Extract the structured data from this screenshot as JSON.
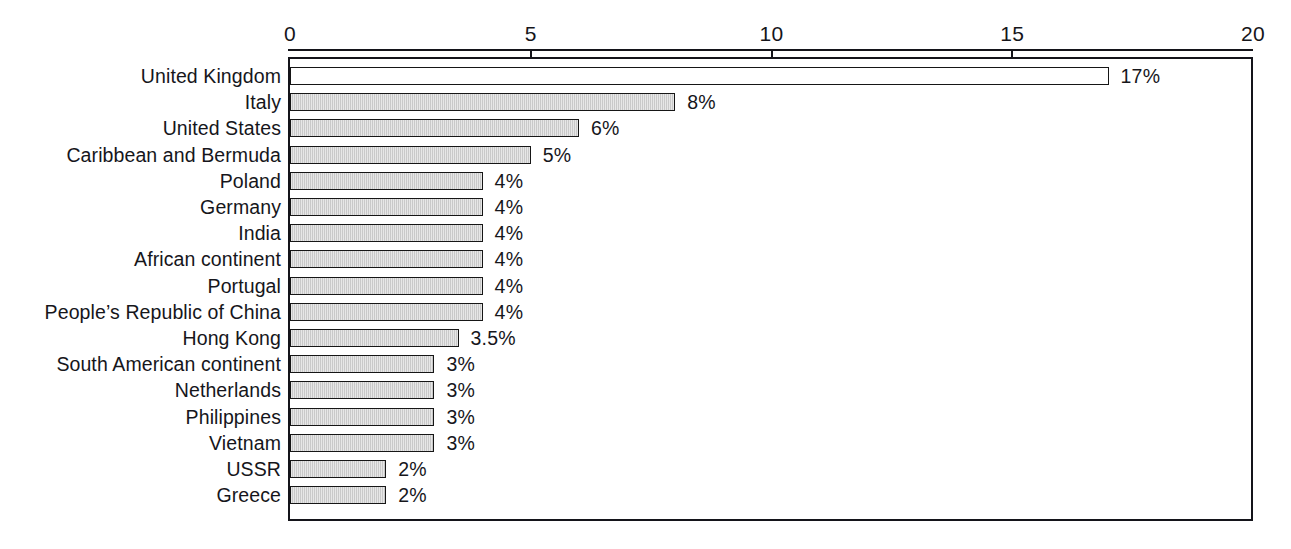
{
  "chart_data": {
    "type": "bar",
    "orientation": "horizontal",
    "title": "",
    "subtitle": "",
    "xlabel": "",
    "ylabel": "",
    "xlim": [
      0,
      20
    ],
    "grid": false,
    "legend": false,
    "axis_ticks": [
      "0",
      "5",
      "10",
      "15",
      "20"
    ],
    "axis_tick_values": [
      0,
      5,
      10,
      15,
      20
    ],
    "categories": [
      "United Kingdom",
      "Italy",
      "United States",
      "Caribbean and Bermuda",
      "Poland",
      "Germany",
      "India",
      "African continent",
      "Portugal",
      "People’s Republic of China",
      "Hong Kong",
      "South American continent",
      "Netherlands",
      "Philippines",
      "Vietnam",
      "USSR",
      "Greece"
    ],
    "values": [
      17,
      8,
      6,
      5,
      4,
      4,
      4,
      4,
      4,
      4,
      3.5,
      3,
      3,
      3,
      3,
      2,
      2
    ],
    "data_labels": [
      "17%",
      "8%",
      "6%",
      "5%",
      "4%",
      "4%",
      "4%",
      "4%",
      "4%",
      "4%",
      "3.5%",
      "3%",
      "3%",
      "3%",
      "3%",
      "2%",
      "2%"
    ],
    "bar_styles": [
      "unfilled",
      "filled",
      "filled",
      "filled",
      "filled",
      "filled",
      "filled",
      "filled",
      "filled",
      "filled",
      "filled",
      "filled",
      "filled",
      "filled",
      "filled",
      "filled",
      "filled"
    ]
  },
  "colors": {
    "bar_fill": "#c9c9c9",
    "bar_fill_highlight": "#ffffff",
    "bar_border": "#161616",
    "axis": "#14141a",
    "text": "#16161b",
    "background": "#ffffff"
  }
}
